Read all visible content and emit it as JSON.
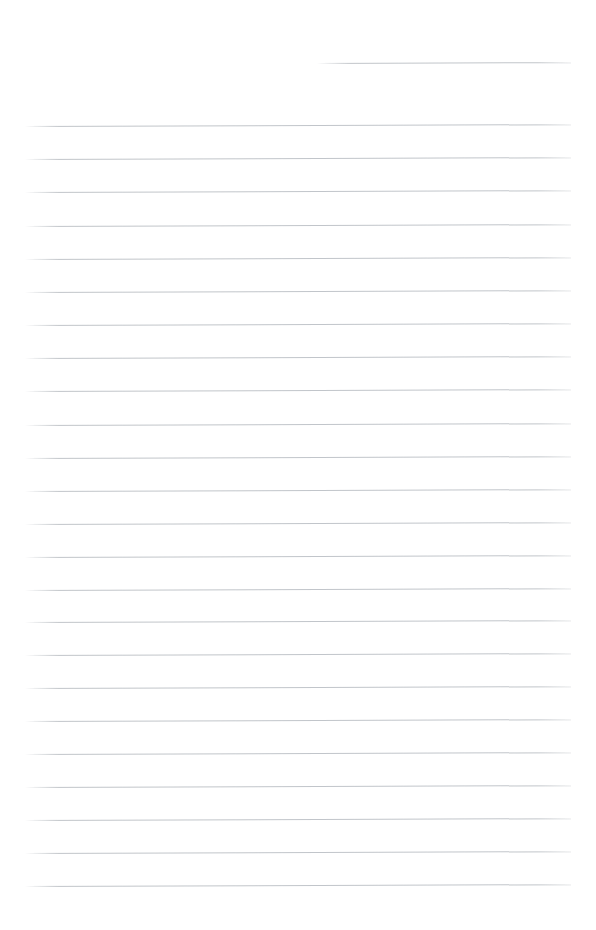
{
  "document": {
    "kind": "blank-ruled-page",
    "title": "",
    "body_text": "",
    "page_width": 596,
    "page_height": 930,
    "background_color": "#ffffff",
    "rule_color": "#bcc0c5",
    "rule_thickness_px": 1,
    "rule_spacing_px": 33.3,
    "skew_px_over_width": -2,
    "left_margin_px": 25,
    "right_margin_px": 571,
    "line_count": 24
  },
  "ruled_lines": [
    {
      "index": 1,
      "y_left": 63,
      "x_start": 317,
      "x_end": 571,
      "partial": true
    },
    {
      "index": 2,
      "y_left": 126,
      "x_start": 25,
      "x_end": 571,
      "partial": false
    },
    {
      "index": 3,
      "y_left": 159,
      "x_start": 25,
      "x_end": 571,
      "partial": false
    },
    {
      "index": 4,
      "y_left": 192,
      "x_start": 25,
      "x_end": 571,
      "partial": false
    },
    {
      "index": 5,
      "y_left": 226,
      "x_start": 25,
      "x_end": 571,
      "partial": false
    },
    {
      "index": 6,
      "y_left": 259,
      "x_start": 25,
      "x_end": 571,
      "partial": false
    },
    {
      "index": 7,
      "y_left": 292,
      "x_start": 25,
      "x_end": 571,
      "partial": false
    },
    {
      "index": 8,
      "y_left": 325,
      "x_start": 25,
      "x_end": 571,
      "partial": false
    },
    {
      "index": 9,
      "y_left": 358,
      "x_start": 25,
      "x_end": 571,
      "partial": false
    },
    {
      "index": 10,
      "y_left": 391,
      "x_start": 25,
      "x_end": 571,
      "partial": false
    },
    {
      "index": 11,
      "y_left": 425,
      "x_start": 25,
      "x_end": 571,
      "partial": false
    },
    {
      "index": 12,
      "y_left": 458,
      "x_start": 25,
      "x_end": 571,
      "partial": false
    },
    {
      "index": 13,
      "y_left": 491,
      "x_start": 25,
      "x_end": 571,
      "partial": false
    },
    {
      "index": 14,
      "y_left": 524,
      "x_start": 25,
      "x_end": 571,
      "partial": false
    },
    {
      "index": 15,
      "y_left": 557,
      "x_start": 25,
      "x_end": 571,
      "partial": false
    },
    {
      "index": 16,
      "y_left": 590,
      "x_start": 25,
      "x_end": 571,
      "partial": false
    },
    {
      "index": 17,
      "y_left": 622,
      "x_start": 25,
      "x_end": 571,
      "partial": false
    },
    {
      "index": 18,
      "y_left": 655,
      "x_start": 25,
      "x_end": 571,
      "partial": false
    },
    {
      "index": 19,
      "y_left": 688,
      "x_start": 25,
      "x_end": 571,
      "partial": false
    },
    {
      "index": 20,
      "y_left": 721,
      "x_start": 25,
      "x_end": 571,
      "partial": false
    },
    {
      "index": 21,
      "y_left": 754,
      "x_start": 25,
      "x_end": 571,
      "partial": false
    },
    {
      "index": 22,
      "y_left": 787,
      "x_start": 25,
      "x_end": 571,
      "partial": false
    },
    {
      "index": 23,
      "y_left": 820,
      "x_start": 25,
      "x_end": 571,
      "partial": false
    },
    {
      "index": 24,
      "y_left": 853,
      "x_start": 25,
      "x_end": 571,
      "partial": false
    },
    {
      "index": 25,
      "y_left": 886,
      "x_start": 25,
      "x_end": 571,
      "partial": false
    }
  ]
}
